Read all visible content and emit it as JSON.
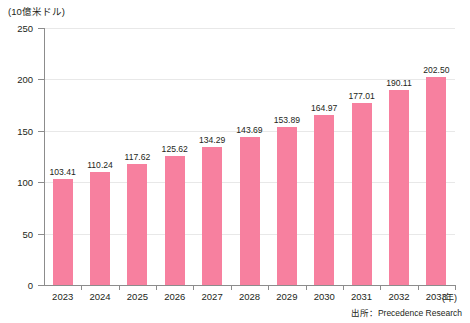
{
  "chart_data": {
    "type": "bar",
    "title": "",
    "subtitle": "",
    "xlabel": "(年)",
    "ylabel": "(10億米ドル)",
    "categories": [
      "2023",
      "2024",
      "2025",
      "2026",
      "2027",
      "2028",
      "2029",
      "2030",
      "2031",
      "2032",
      "2033"
    ],
    "values": [
      103.41,
      110.24,
      117.62,
      125.62,
      134.29,
      143.69,
      153.89,
      164.97,
      177.01,
      190.11,
      202.5
    ],
    "value_labels": [
      "103.41",
      "110.24",
      "117.62",
      "125.62",
      "134.29",
      "143.69",
      "153.89",
      "164.97",
      "177.01",
      "190.11",
      "202.50"
    ],
    "ylim": [
      0,
      250
    ],
    "yticks": [
      0,
      50,
      100,
      150,
      200,
      250
    ],
    "ytick_labels": [
      "0",
      "50",
      "100",
      "150",
      "200",
      "250"
    ],
    "grid": true,
    "legend": null,
    "series": [
      {
        "name": "市場規模",
        "values": [
          103.41,
          110.24,
          117.62,
          125.62,
          134.29,
          143.69,
          153.89,
          164.97,
          177.01,
          190.11,
          202.5
        ]
      }
    ],
    "bar_color": "#F7809F",
    "annotations": {
      "source": "出所：Precedence Research"
    }
  },
  "axis": {
    "y_unit_caption": "(10億米ドル)",
    "x_unit_caption": "(年)"
  },
  "footer": {
    "source_text": "出所：Precedence Research"
  }
}
